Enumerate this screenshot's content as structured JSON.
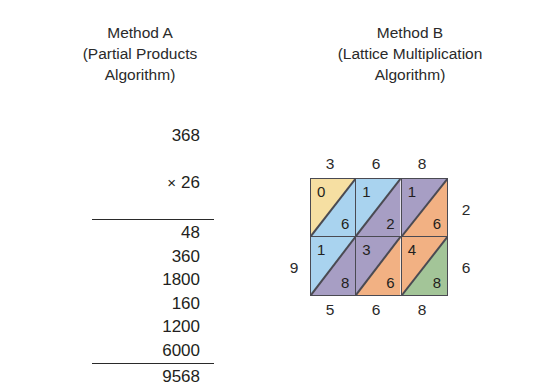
{
  "methods": {
    "a": {
      "title_line1": "Method A",
      "title_line2": "(Partial Products",
      "title_line3": "Algorithm)",
      "multiplicand": "368",
      "times_symbol": "×",
      "multiplier": "26",
      "partials": [
        "48",
        "360",
        "1800",
        "160",
        "1200",
        "6000"
      ],
      "product": "9568"
    },
    "b": {
      "title_line1": "Method B",
      "title_line2": "(Lattice Multiplication",
      "title_line3": "Algorithm)",
      "top_labels": [
        "3",
        "6",
        "8"
      ],
      "bottom_labels": [
        "5",
        "6",
        "8"
      ],
      "left_label": "9",
      "right_labels": [
        "2",
        "6"
      ],
      "cells": [
        [
          {
            "tens": "0",
            "ones": "6",
            "upper_color": "#f6dfa2",
            "lower_color": "#a9d3ef"
          },
          {
            "tens": "1",
            "ones": "2",
            "upper_color": "#a9d3ef",
            "lower_color": "#a79ec4"
          },
          {
            "tens": "1",
            "ones": "6",
            "upper_color": "#a79ec4",
            "lower_color": "#f2b183"
          }
        ],
        [
          {
            "tens": "1",
            "ones": "8",
            "upper_color": "#a9d3ef",
            "lower_color": "#a79ec4"
          },
          {
            "tens": "3",
            "ones": "6",
            "upper_color": "#a79ec4",
            "lower_color": "#f2b183"
          },
          {
            "tens": "4",
            "ones": "8",
            "upper_color": "#f2b183",
            "lower_color": "#a3c598"
          }
        ]
      ]
    }
  },
  "colors": {
    "ink": "#231f20",
    "rule": "#2a2a2a",
    "grid_line": "#4a4a52",
    "background": "#ffffff"
  }
}
